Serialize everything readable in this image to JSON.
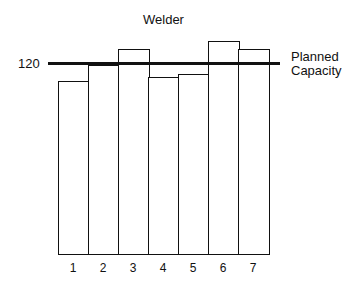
{
  "chart_data": {
    "type": "bar",
    "title": "Welder",
    "categories": [
      "1",
      "2",
      "3",
      "4",
      "5",
      "6",
      "7"
    ],
    "values": [
      109,
      119,
      129,
      111,
      113,
      134,
      129
    ],
    "xlabel": "",
    "ylabel": "",
    "ylim": [
      0,
      140
    ],
    "yticks": [
      120
    ],
    "reference_line": {
      "value": 120,
      "label_line1": "Planned",
      "label_line2": "Capacity"
    },
    "grid": false,
    "legend_position": "right"
  },
  "labels": {
    "y_tick": "120",
    "planned_1": "Planned",
    "planned_2": "Capacity"
  }
}
